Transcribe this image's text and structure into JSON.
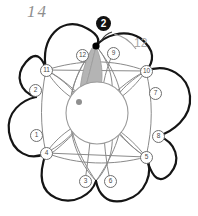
{
  "diagram": {
    "title_annotation": "14",
    "side_annotation": "12",
    "step_marker": "2",
    "center_circle_label": "",
    "colors": {
      "petal_outline": "#151515",
      "inner_arc": "#8a8a8a",
      "center_circle": "#9a9a9a",
      "shaded_lens": "#b0b0b0",
      "node_border": "#6e6e6e",
      "node_text": "#4a4a4a",
      "annotation_gray": "#a9a9a9",
      "hand_gray": "#8e8e8e",
      "marker_fill": "#111111",
      "point_black": "#000000",
      "point_gray": "#8f8f8f"
    },
    "nodes": [
      {
        "label": "1",
        "x": 36,
        "y": 135
      },
      {
        "label": "2",
        "x": 35,
        "y": 90
      },
      {
        "label": "3",
        "x": 85,
        "y": 181
      },
      {
        "label": "4",
        "x": 46,
        "y": 153
      },
      {
        "label": "5",
        "x": 146,
        "y": 157
      },
      {
        "label": "6",
        "x": 110,
        "y": 181
      },
      {
        "label": "7",
        "x": 155,
        "y": 93
      },
      {
        "label": "8",
        "x": 158,
        "y": 136
      },
      {
        "label": "9",
        "x": 113,
        "y": 53
      },
      {
        "label": "10",
        "x": 146,
        "y": 71
      },
      {
        "label": "11",
        "x": 46,
        "y": 70
      },
      {
        "label": "12",
        "x": 82,
        "y": 55
      }
    ],
    "points": [
      {
        "name": "apex-point",
        "x": 96,
        "y": 46,
        "color": "#000000",
        "r": 3.4
      },
      {
        "name": "lens-foot-point",
        "x": 79,
        "y": 102,
        "color": "#8f8f8f",
        "r": 3.0
      }
    ]
  }
}
